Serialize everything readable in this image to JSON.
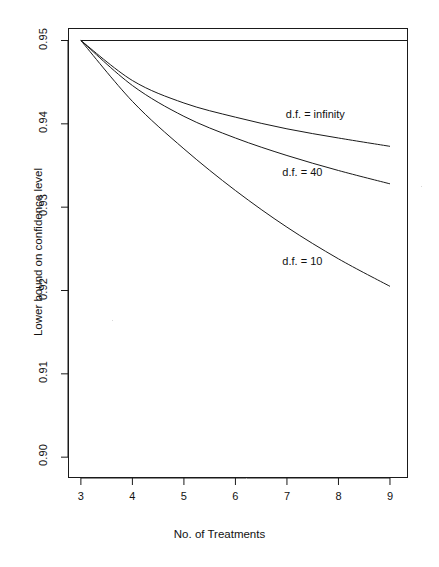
{
  "chart_data": {
    "type": "line",
    "title": "",
    "subtitle": "",
    "xlabel": "No. of Treatments",
    "ylabel": "Lower bound on confidence level",
    "xlim": [
      2.75,
      9.35
    ],
    "ylim": [
      0.8975,
      0.9515
    ],
    "xticks": [
      3,
      4,
      5,
      6,
      7,
      8,
      9
    ],
    "xtick_labels": [
      "3",
      "4",
      "5",
      "6",
      "7",
      "8",
      "9"
    ],
    "yticks": [
      0.95,
      0.94,
      0.93,
      0.92,
      0.91,
      0.9
    ],
    "ytick_labels": [
      "0.95",
      "0.94",
      "0.93",
      "0.92",
      "0.91",
      "0.90"
    ],
    "grid": false,
    "legend_position": "inline-annotations",
    "x": [
      3,
      4,
      5,
      6,
      7,
      8,
      9
    ],
    "series": [
      {
        "name": "reference",
        "label": "",
        "values": [
          0.95,
          0.95,
          0.95,
          0.95,
          0.95,
          0.95,
          0.95
        ],
        "color": "#1a1a1a"
      },
      {
        "name": "df_infinity",
        "label": "d.f. = infinity",
        "values": [
          0.95,
          0.9452,
          0.9425,
          0.9408,
          0.9394,
          0.9383,
          0.9373
        ],
        "color": "#1a1a1a"
      },
      {
        "name": "df_40",
        "label": "d.f. = 40",
        "values": [
          0.95,
          0.9446,
          0.9409,
          0.9383,
          0.9362,
          0.9344,
          0.9328
        ],
        "color": "#1a1a1a"
      },
      {
        "name": "df_10",
        "label": "d.f. = 10",
        "values": [
          0.95,
          0.9427,
          0.937,
          0.932,
          0.9276,
          0.9238,
          0.9205
        ],
        "color": "#1a1a1a"
      }
    ],
    "annotations": [
      {
        "text": "d.f. = infinity",
        "x": 7.55,
        "y": 0.9411
      },
      {
        "text": "d.f. = 40",
        "x": 7.3,
        "y": 0.9341
      },
      {
        "text": "d.f. = 10",
        "x": 7.3,
        "y": 0.9234
      }
    ],
    "axis_color": "#1a1a1a",
    "background": "#ffffff"
  }
}
